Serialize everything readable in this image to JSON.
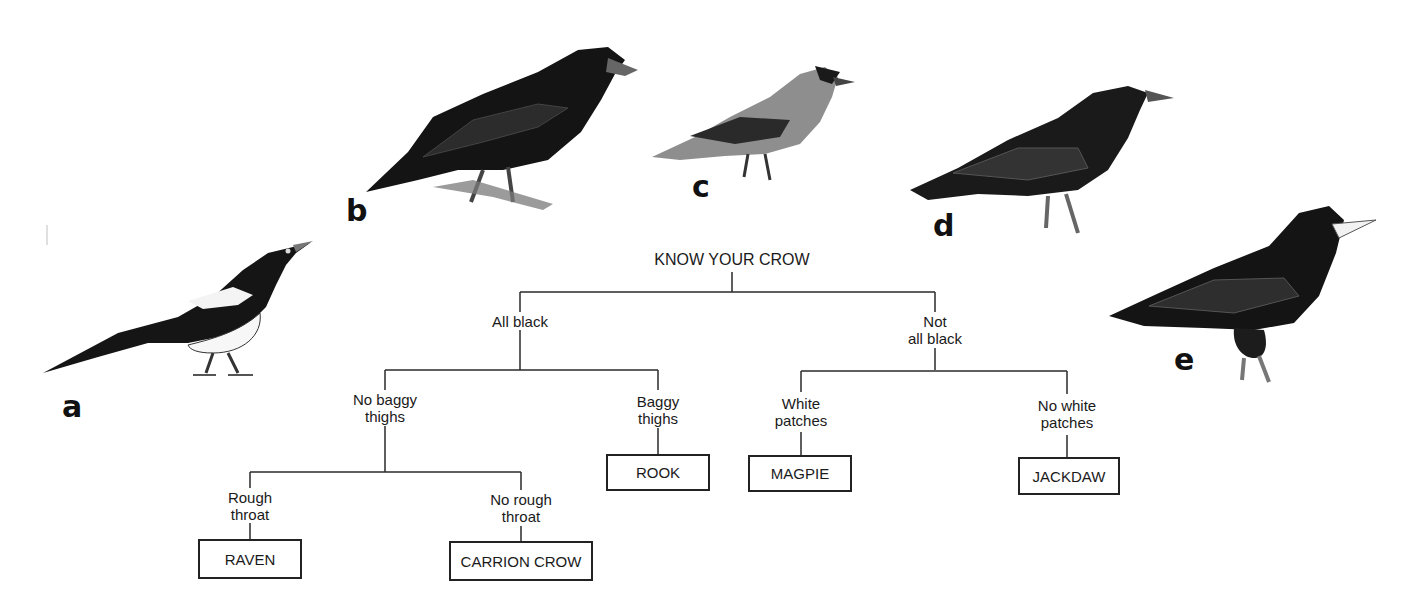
{
  "birds": [
    {
      "letter": "a",
      "species": "magpie"
    },
    {
      "letter": "b",
      "species": "raven"
    },
    {
      "letter": "c",
      "species": "jackdaw"
    },
    {
      "letter": "d",
      "species": "carrion crow"
    },
    {
      "letter": "e",
      "species": "rook"
    }
  ],
  "key": {
    "title": "KNOW YOUR CROW",
    "branches": {
      "all_black": "All black",
      "not_all_black_1": "Not",
      "not_all_black_2": "all black",
      "no_baggy_1": "No baggy",
      "no_baggy_2": "thighs",
      "baggy_1": "Baggy",
      "baggy_2": "thighs",
      "white_1": "White",
      "white_2": "patches",
      "no_white_1": "No white",
      "no_white_2": "patches",
      "rough_1": "Rough",
      "rough_2": "throat",
      "no_rough_1": "No rough",
      "no_rough_2": "throat"
    },
    "leaves": {
      "raven": "RAVEN",
      "carrion_crow": "CARRION CROW",
      "rook": "ROOK",
      "magpie": "MAGPIE",
      "jackdaw": "JACKDAW"
    }
  },
  "colors": {
    "line": "#2a2a2a",
    "bird_dark": "#151515",
    "bird_mid": "#3a3a3a",
    "bird_grey": "#9a9a9a",
    "background": "#ffffff"
  }
}
